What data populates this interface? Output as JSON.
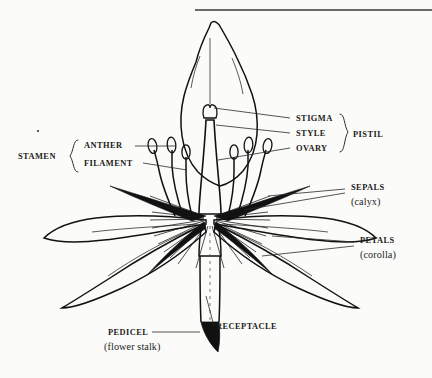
{
  "figure": {
    "kind": "botanical-diagram",
    "background_color": "#fbfbf9",
    "ink_color": "#111111"
  },
  "top_rule": {
    "present": true,
    "x_start": 195,
    "x_end": 432,
    "y": 10
  },
  "labels": {
    "stamen": {
      "text": "STAMEN",
      "x": 18,
      "y": 159
    },
    "anther": {
      "text": "ANTHER",
      "x": 84,
      "y": 148
    },
    "filament": {
      "text": "FILAMENT",
      "x": 84,
      "y": 166
    },
    "stigma": {
      "text": "STIGMA",
      "x": 296,
      "y": 121
    },
    "style": {
      "text": "STYLE",
      "x": 296,
      "y": 136
    },
    "ovary": {
      "text": "OVARY",
      "x": 296,
      "y": 151
    },
    "pistil": {
      "text": "PISTIL",
      "x": 353,
      "y": 137
    },
    "sepals": {
      "text": "SEPALS",
      "x": 351,
      "y": 190
    },
    "calyx": {
      "text": "(calyx)",
      "x": 351,
      "y": 205
    },
    "petals": {
      "text": "PETALS",
      "x": 360,
      "y": 243
    },
    "corolla": {
      "text": "(corolla)",
      "x": 360,
      "y": 258
    },
    "pedicel": {
      "text": "PEDICEL",
      "x": 108,
      "y": 335
    },
    "flower_stalk": {
      "text": "(flower stalk)",
      "x": 104,
      "y": 350
    },
    "receptacle": {
      "text": "RECEPTACLE",
      "x": 216,
      "y": 329
    }
  },
  "parts": [
    {
      "name": "stigma",
      "note": "bilobed knob at top of style"
    },
    {
      "name": "style",
      "note": "slender column below stigma"
    },
    {
      "name": "ovary",
      "note": "swollen base of pistil"
    },
    {
      "name": "anther",
      "note": "oval pollen sac atop each filament"
    },
    {
      "name": "filament",
      "note": "slender stalk of stamen"
    },
    {
      "name": "sepal",
      "note": "dark narrow outer whorl, calyx"
    },
    {
      "name": "petal",
      "note": "large pale outer whorl, corolla"
    },
    {
      "name": "receptacle",
      "note": "enlarged stem tip bearing floral parts"
    },
    {
      "name": "pedicel",
      "note": "flower stalk"
    }
  ],
  "counts": {
    "stamens": 6,
    "sepals": 4,
    "petals": 4
  }
}
